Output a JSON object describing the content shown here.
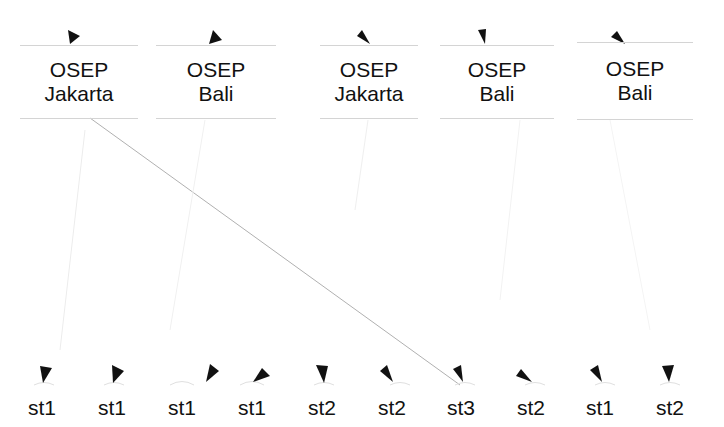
{
  "diagram": {
    "type": "tree",
    "top_nodes": [
      {
        "line1": "OSEP",
        "line2": "Jakarta"
      },
      {
        "line1": "OSEP",
        "line2": "Bali"
      },
      {
        "line1": "OSEP",
        "line2": "Jakarta"
      },
      {
        "line1": "OSEP",
        "line2": "Bali"
      },
      {
        "line1": "OSEP",
        "line2": "Bali"
      }
    ],
    "leaves": [
      {
        "label": "st1"
      },
      {
        "label": "st1"
      },
      {
        "label": "st1"
      },
      {
        "label": "st1"
      },
      {
        "label": "st2"
      },
      {
        "label": "st2"
      },
      {
        "label": "st3"
      },
      {
        "label": "st2"
      },
      {
        "label": "st1"
      },
      {
        "label": "st2"
      }
    ]
  }
}
